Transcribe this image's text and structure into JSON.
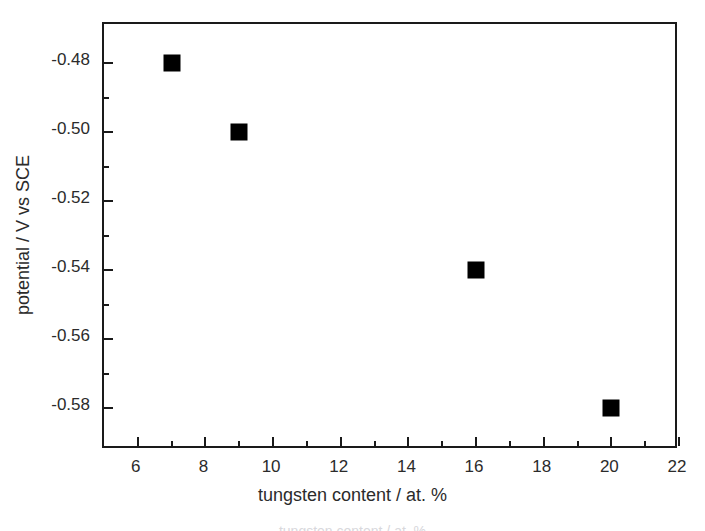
{
  "figure": {
    "background_color": "#ffffff",
    "frame_color": "#1a1a1a",
    "marker_color": "#000000",
    "text_color": "#2b2b2b"
  },
  "chart_data": {
    "type": "scatter",
    "title": "",
    "xlabel": "tungsten content / at. %",
    "ylabel": "potential / V vs SCE",
    "xlim": [
      5,
      22
    ],
    "ylim": [
      -0.5921,
      -0.4686
    ],
    "grid": false,
    "legend": null,
    "marker_style": "filled-square",
    "x": [
      7,
      9,
      16,
      20
    ],
    "y": [
      -0.48,
      -0.5,
      -0.54,
      -0.58
    ],
    "points": [
      {
        "x": 7,
        "y": -0.48
      },
      {
        "x": 9,
        "y": -0.5
      },
      {
        "x": 16,
        "y": -0.54
      },
      {
        "x": 20,
        "y": -0.58
      }
    ],
    "x_ticks_major": [
      6,
      8,
      10,
      12,
      14,
      16,
      18,
      20,
      22
    ],
    "x_tick_labels": [
      "6",
      "8",
      "10",
      "12",
      "14",
      "16",
      "18",
      "20",
      "22"
    ],
    "x_ticks_minor": [
      7,
      9,
      11,
      13,
      15,
      17,
      19,
      21
    ],
    "y_ticks_major": [
      -0.48,
      -0.5,
      -0.52,
      -0.54,
      -0.56,
      -0.58
    ],
    "y_tick_labels": [
      "-0.48",
      "-0.50",
      "-0.52",
      "-0.54",
      "-0.56",
      "-0.58"
    ],
    "y_ticks_minor": [
      -0.49,
      -0.51,
      -0.53,
      -0.55,
      -0.57
    ]
  },
  "caption": {
    "partial_text": "tungsten content / at. %"
  }
}
